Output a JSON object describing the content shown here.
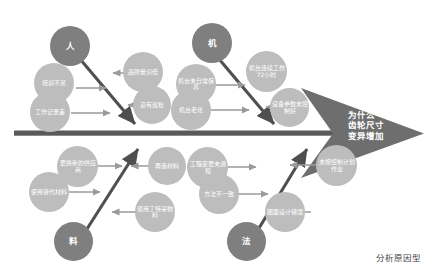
{
  "diagram": {
    "type": "fishbone-ishikawa",
    "caption": "分析原因型",
    "problem": "为什么\n齿轮尺寸\n变异增加",
    "colors": {
      "category_bubble": "#7f7f7f",
      "sub_bubble": "#bdbdbd",
      "spine": "#5a5a5a",
      "branch": "#4f4f4f",
      "connector": "#9a9a9a",
      "head": "#6e6e6e",
      "background": "#ffffff",
      "caption_text": "#3f3f3f"
    },
    "categories": [
      {
        "id": "ren",
        "label": "人",
        "position": "top-left",
        "causes": [
          {
            "id": "ren-c1",
            "label": "培训不足"
          },
          {
            "id": "ren-c2",
            "label": "工作记录差"
          },
          {
            "id": "ren-c3",
            "label": "品牌量识低"
          },
          {
            "id": "ren-c4",
            "label": "没有巡检"
          }
        ]
      },
      {
        "id": "ji",
        "label": "机",
        "position": "top-right",
        "causes": [
          {
            "id": "ji-c1",
            "label": "机台未日常保养"
          },
          {
            "id": "ji-c2",
            "label": "机台老化"
          },
          {
            "id": "ji-c3",
            "label": "机台连续工作72小时"
          },
          {
            "id": "ji-c4",
            "label": "设备参数未控制好"
          }
        ]
      },
      {
        "id": "liao",
        "label": "料",
        "position": "bottom-left",
        "causes": [
          {
            "id": "liao-c1",
            "label": "更换新的供应商"
          },
          {
            "id": "liao-c2",
            "label": "使用替代材料"
          },
          {
            "id": "liao-c3",
            "label": "再造材料"
          },
          {
            "id": "liao-c4",
            "label": "使用了特采物料"
          }
        ]
      },
      {
        "id": "fa",
        "label": "法",
        "position": "bottom-right",
        "causes": [
          {
            "id": "fa-c1",
            "label": "工程变更未通知"
          },
          {
            "id": "fa-c2",
            "label": "方法不一致"
          },
          {
            "id": "fa-c3",
            "label": "未按控制计划作业"
          },
          {
            "id": "fa-c4",
            "label": "图面设计错误"
          }
        ]
      }
    ]
  }
}
